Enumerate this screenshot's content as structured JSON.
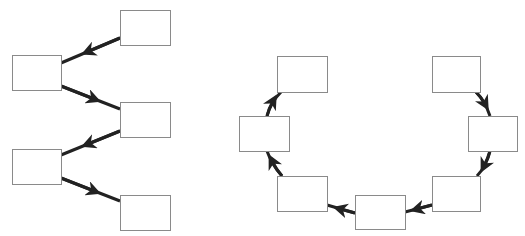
{
  "colors": {
    "box_stroke": "#8a8a8a",
    "edge": "#222222",
    "background": "#ffffff"
  },
  "diagrams": [
    {
      "name": "branching-tree",
      "nodes": [
        {
          "id": "A",
          "x": 120,
          "y": 10,
          "w": 50,
          "h": 35,
          "label": ""
        },
        {
          "id": "B",
          "x": 12,
          "y": 55,
          "w": 49,
          "h": 35,
          "label": ""
        },
        {
          "id": "C",
          "x": 120,
          "y": 102,
          "w": 50,
          "h": 35,
          "label": ""
        },
        {
          "id": "D",
          "x": 12,
          "y": 149,
          "w": 49,
          "h": 35,
          "label": ""
        },
        {
          "id": "E",
          "x": 120,
          "y": 195,
          "w": 50,
          "h": 35,
          "label": ""
        }
      ],
      "edges": [
        {
          "from": "A",
          "to": "B"
        },
        {
          "from": "B",
          "to": "C"
        },
        {
          "from": "C",
          "to": "D"
        },
        {
          "from": "D",
          "to": "E"
        }
      ]
    },
    {
      "name": "cycle-arc",
      "nodes": [
        {
          "id": "R1",
          "x": 432,
          "y": 56,
          "w": 48,
          "h": 36,
          "label": ""
        },
        {
          "id": "R2",
          "x": 468,
          "y": 116,
          "w": 49,
          "h": 35,
          "label": ""
        },
        {
          "id": "R3",
          "x": 432,
          "y": 176,
          "w": 48,
          "h": 35,
          "label": ""
        },
        {
          "id": "R4",
          "x": 355,
          "y": 195,
          "w": 50,
          "h": 34,
          "label": ""
        },
        {
          "id": "R5",
          "x": 277,
          "y": 176,
          "w": 50,
          "h": 35,
          "label": ""
        },
        {
          "id": "R6",
          "x": 239,
          "y": 116,
          "w": 50,
          "h": 35,
          "label": ""
        },
        {
          "id": "R7",
          "x": 277,
          "y": 56,
          "w": 50,
          "h": 36,
          "label": ""
        }
      ],
      "edges": [
        {
          "from": "R1",
          "to": "R2"
        },
        {
          "from": "R2",
          "to": "R3"
        },
        {
          "from": "R3",
          "to": "R4"
        },
        {
          "from": "R4",
          "to": "R5"
        },
        {
          "from": "R5",
          "to": "R6"
        },
        {
          "from": "R6",
          "to": "R7"
        }
      ]
    }
  ]
}
